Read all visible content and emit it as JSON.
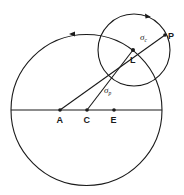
{
  "diagram": {
    "type": "geometry",
    "large_circle": {
      "center": "C",
      "cx": 86.5,
      "cy": 110,
      "r": 75.5,
      "direction_arrow": "counterclockwise"
    },
    "small_circle": {
      "center": "L",
      "cx": 134,
      "cy": 50,
      "r": 36,
      "direction_arrow": "clockwise"
    },
    "points": [
      {
        "id": "A",
        "label": "A",
        "x": 60,
        "y": 110
      },
      {
        "id": "C",
        "label": "C",
        "x": 87,
        "y": 110
      },
      {
        "id": "E",
        "label": "E",
        "x": 114,
        "y": 110
      },
      {
        "id": "L",
        "label": "L",
        "x": 133,
        "y": 50
      },
      {
        "id": "P",
        "label": "P",
        "x": 165,
        "y": 35
      }
    ],
    "segments": [
      {
        "from": "A",
        "to": "P"
      },
      {
        "from": "C",
        "to": "L"
      },
      {
        "from": "diameter-left",
        "to": "diameter-right"
      }
    ],
    "annotations": {
      "sigma_c": {
        "base": "σ",
        "subscript": "c",
        "segment": "L-P"
      },
      "sigma_p": {
        "base": "σ",
        "subscript": "p",
        "segment": "C-L"
      }
    }
  }
}
